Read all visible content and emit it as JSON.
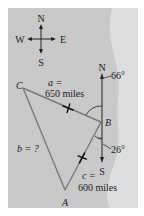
{
  "compass": {
    "north": "N",
    "south": "S",
    "east": "E",
    "west": "W"
  },
  "triangle": {
    "vertices": {
      "A": "A",
      "B": "B",
      "C": "C"
    },
    "sides": {
      "a_label": "a =",
      "a_value": "650 miles",
      "b_label": "b = ?",
      "c_label": "c =",
      "c_value": "600 miles"
    }
  },
  "bearing_at_B": {
    "north": "N",
    "south": "S",
    "angle_north": "66°",
    "angle_south": "26°"
  },
  "colors": {
    "panel": "#c9c9c9",
    "coast": "#dcdcdc",
    "triangle_line": "#7a7a7a",
    "text": "#1a1a1a"
  }
}
